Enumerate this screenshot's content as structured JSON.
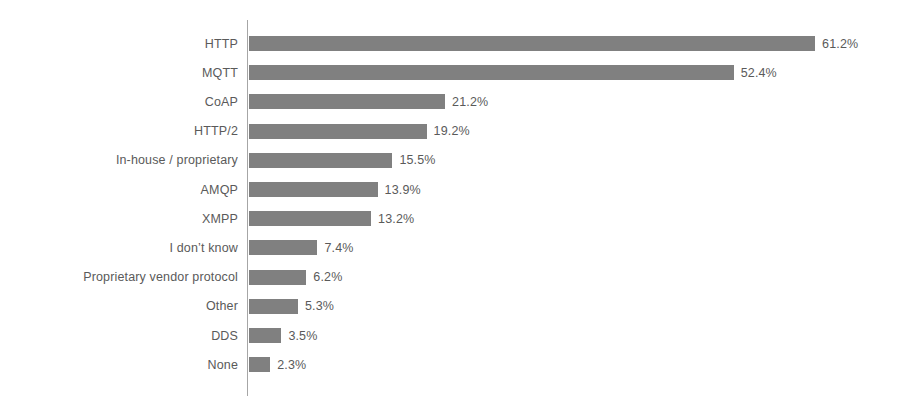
{
  "chart_data": {
    "type": "bar",
    "orientation": "horizontal",
    "title": "",
    "subtitle": "",
    "xlabel": "",
    "ylabel": "",
    "grid": false,
    "legend": false,
    "axis_line": "vertical-left",
    "value_suffix": "%",
    "xlim": [
      0,
      61.2
    ],
    "bar_color": "#808080",
    "text_color": "#5a5a5a",
    "background_color": "#ffffff",
    "categories": [
      "HTTP",
      "MQTT",
      "CoAP",
      "HTTP/2",
      "In-house / proprietary",
      "AMQP",
      "XMPP",
      "I don’t know",
      "Proprietary vendor protocol",
      "Other",
      "DDS",
      "None"
    ],
    "values": [
      61.2,
      52.4,
      21.2,
      19.2,
      15.5,
      13.9,
      13.2,
      7.4,
      6.2,
      5.3,
      3.5,
      2.3
    ],
    "value_labels": [
      "61.2%",
      "52.4%",
      "21.2%",
      "19.2%",
      "15.5%",
      "13.9%",
      "13.2%",
      "7.4%",
      "6.2%",
      "5.3%",
      "3.5%",
      "2.3%"
    ]
  }
}
